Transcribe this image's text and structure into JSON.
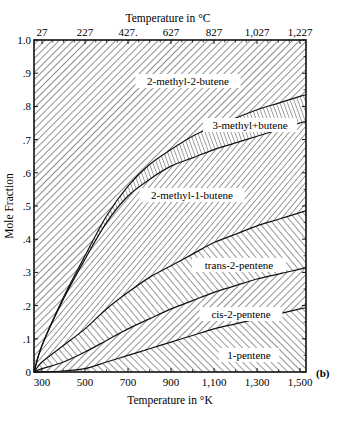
{
  "chart_data": {
    "type": "area",
    "stacked": true,
    "title": "",
    "panel_label": "(b)",
    "xlabel": "Temperature in °K",
    "x2label": "Temperature in °C",
    "ylabel": "Mole Fraction",
    "xlim": [
      263,
      1528
    ],
    "ylim": [
      0,
      1.0
    ],
    "x_ticks": [
      300,
      500,
      700,
      900,
      1100,
      1300,
      1500
    ],
    "x_tick_labels": [
      "300",
      "500",
      "700",
      "900",
      "1,100",
      "1,300",
      "1,500"
    ],
    "x2_ticks_K": [
      300,
      500,
      700,
      900,
      1100,
      1300,
      1500
    ],
    "x2_tick_labels": [
      "27",
      "227",
      "427.",
      "627",
      "827",
      "1,027",
      "1,227"
    ],
    "y_ticks": [
      0,
      0.1,
      0.2,
      0.3,
      0.4,
      0.5,
      0.6,
      0.7,
      0.8,
      0.9,
      1.0
    ],
    "y_tick_labels": [
      "0",
      ".1",
      ".2",
      ".3",
      ".4",
      ".5",
      ".6",
      ".7",
      ".8",
      ".9",
      "1.0"
    ],
    "grid": false,
    "legend": "inline region labels",
    "x": [
      263,
      300,
      400,
      500,
      600,
      700,
      800,
      900,
      1000,
      1100,
      1200,
      1300,
      1400,
      1500,
      1528
    ],
    "series": [
      {
        "name": "1-pentene",
        "cumulative_upper": [
          0.0,
          0.0,
          0.003,
          0.01,
          0.03,
          0.05,
          0.07,
          0.09,
          0.11,
          0.13,
          0.145,
          0.16,
          0.175,
          0.19,
          0.193
        ]
      },
      {
        "name": "cis-2-pentene",
        "cumulative_upper": [
          0.0,
          0.01,
          0.03,
          0.06,
          0.095,
          0.13,
          0.16,
          0.19,
          0.215,
          0.24,
          0.26,
          0.28,
          0.295,
          0.31,
          0.315
        ]
      },
      {
        "name": "trans-2-pentene",
        "cumulative_upper": [
          0.0,
          0.03,
          0.08,
          0.13,
          0.19,
          0.24,
          0.285,
          0.32,
          0.355,
          0.39,
          0.415,
          0.44,
          0.46,
          0.48,
          0.485
        ]
      },
      {
        "name": "2-methyl-1-butene",
        "cumulative_upper": [
          0.0,
          0.08,
          0.22,
          0.34,
          0.45,
          0.53,
          0.58,
          0.62,
          0.645,
          0.67,
          0.69,
          0.71,
          0.73,
          0.75,
          0.755
        ]
      },
      {
        "name": "3-methyl-1-butene",
        "cumulative_upper": [
          0.0,
          0.08,
          0.225,
          0.35,
          0.47,
          0.56,
          0.625,
          0.67,
          0.71,
          0.74,
          0.765,
          0.79,
          0.81,
          0.83,
          0.835
        ]
      },
      {
        "name": "2-methyl-2-butene",
        "cumulative_upper": [
          1.0,
          1.0,
          1.0,
          1.0,
          1.0,
          1.0,
          1.0,
          1.0,
          1.0,
          1.0,
          1.0,
          1.0,
          1.0,
          1.0,
          1.0
        ]
      }
    ],
    "region_labels": [
      {
        "name": "2-methyl-2-butene",
        "label": "2-methyl-2-butene"
      },
      {
        "name": "3-methyl-1-butene",
        "label": "3-methyl+butene"
      },
      {
        "name": "2-methyl-1-butene",
        "label": "2-methyl-1-butene"
      },
      {
        "name": "trans-2-pentene",
        "label": "trans-2-pentene"
      },
      {
        "name": "cis-2-pentene",
        "label": "cis-2-pentene"
      },
      {
        "name": "1-pentene",
        "label": "1-pentene"
      }
    ]
  }
}
